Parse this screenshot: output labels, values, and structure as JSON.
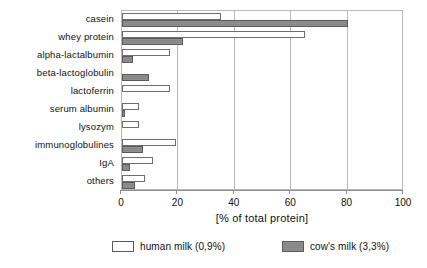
{
  "chart_data": {
    "type": "bar",
    "orientation": "horizontal",
    "title": "",
    "subtitle": "",
    "xlabel": "[% of total protein]",
    "ylabel": "",
    "xlim": [
      0,
      100
    ],
    "xticks": [
      0,
      20,
      40,
      60,
      80,
      100
    ],
    "xtick_labels": [
      "0",
      "20",
      "40",
      "60",
      "80",
      "100"
    ],
    "grid": true,
    "grid_axis": "x",
    "legend_position": "bottom",
    "categories": [
      "casein",
      "whey protein",
      "alpha-lactalbumin",
      "beta-lactoglobulin",
      "lactoferrin",
      "serum albumin",
      "lysozym",
      "immunoglobulines",
      "IgA",
      "others"
    ],
    "series": [
      {
        "name": "human milk (0,9%)",
        "key": "human",
        "color": "#ffffff",
        "edge_color": "#6e6e6e",
        "values": [
          35,
          65,
          17,
          0,
          17,
          6,
          6,
          19,
          11,
          8
        ]
      },
      {
        "name": "cow's milk (3,3%)",
        "key": "cow",
        "color": "#848484",
        "edge_color": "#5a5a5a",
        "values": [
          80,
          21.5,
          4,
          9.5,
          0,
          1,
          0,
          7.5,
          3,
          4.5
        ]
      }
    ],
    "annotations": []
  },
  "legend": {
    "entries": [
      {
        "label": "human milk (0,9%)",
        "swatch": "human"
      },
      {
        "label": "cow's milk (3,3%)",
        "swatch": "cow"
      }
    ]
  },
  "colors": {
    "human_fill": "#ffffff",
    "cow_fill": "#848484",
    "axis": "#8c8c8c",
    "grid": "#b9b9b9",
    "text": "#111111",
    "background": "#ffffff"
  }
}
